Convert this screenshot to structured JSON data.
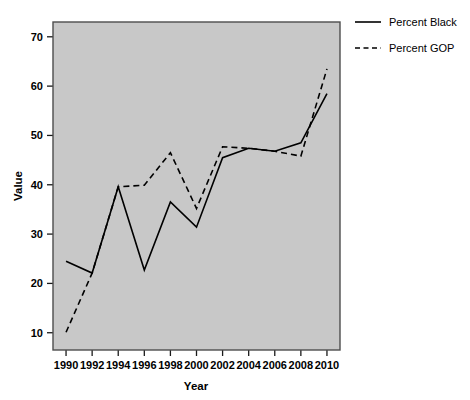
{
  "chart_data": {
    "type": "line",
    "title": "",
    "xlabel": "Year",
    "ylabel": "Value",
    "x": [
      1990,
      1992,
      1994,
      1996,
      1998,
      2000,
      2002,
      2004,
      2006,
      2008,
      2010
    ],
    "categories": [
      "1990",
      "1992",
      "1994",
      "1996",
      "1998",
      "2000",
      "2002",
      "2004",
      "2006",
      "2008",
      "2010"
    ],
    "series": [
      {
        "name": "Percent Black",
        "style": "solid",
        "color": "#000000",
        "values": [
          24.5,
          22.1,
          39.6,
          22.7,
          36.5,
          31.4,
          45.5,
          47.4,
          46.8,
          48.5,
          58.5
        ]
      },
      {
        "name": "Percent GOP",
        "style": "dashed",
        "color": "#000000",
        "values": [
          10.1,
          22.1,
          39.6,
          39.9,
          46.5,
          35.2,
          47.7,
          47.4,
          46.8,
          45.8,
          63.5
        ]
      }
    ],
    "xlim": [
      1989.0,
      2011.0
    ],
    "ylim": [
      6.5,
      73.0
    ],
    "xticks": [
      1990,
      1992,
      1994,
      1996,
      1998,
      2000,
      2002,
      2004,
      2006,
      2008,
      2010
    ],
    "xtick_labels": [
      "1990",
      "1992",
      "1994",
      "1996",
      "1998",
      "2000",
      "2002",
      "2004",
      "2006",
      "2008",
      "2010"
    ],
    "yticks": [
      10,
      20,
      30,
      40,
      50,
      60,
      70
    ],
    "ytick_labels": [
      "10",
      "20",
      "30",
      "40",
      "50",
      "60",
      "70"
    ],
    "grid": false,
    "legend_position": "top-right",
    "plot_background": "#c8c8c8",
    "figure_background": "#ffffff",
    "border_color": "#4d4d4d"
  },
  "legend": {
    "entries": [
      {
        "label": "Percent Black",
        "style": "solid"
      },
      {
        "label": "Percent GOP",
        "style": "dashed"
      }
    ]
  },
  "axes": {
    "y_title": "Value",
    "x_title": "Year"
  }
}
